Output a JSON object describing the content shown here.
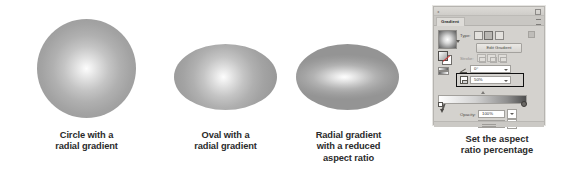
{
  "figures": [
    {
      "id": "circle-radial",
      "caption_lines": [
        "Circle with a",
        "radial gradient"
      ],
      "shape": "circle"
    },
    {
      "id": "oval-radial",
      "caption_lines": [
        "Oval with a",
        "radial gradient"
      ],
      "shape": "oval"
    },
    {
      "id": "oval-reduced-aspect",
      "caption_lines": [
        "Radial gradient",
        "with a reduced",
        "aspect ratio"
      ],
      "shape": "oval"
    },
    {
      "id": "gradient-panel",
      "caption_lines": [
        "Set the aspect",
        "ratio percentage"
      ],
      "shape": "panel"
    }
  ],
  "panel": {
    "tab_label": "Gradient",
    "type_label": "Type:",
    "type_options": [
      "linear",
      "radial",
      "freeform"
    ],
    "type_selected": "radial",
    "edit_gradient_label": "Edit Gradient",
    "stroke_label": "Stroke:",
    "angle_label": "Angle:",
    "angle_value": "0°",
    "aspect_ratio_label": "Aspect Ratio:",
    "aspect_ratio_value": "50%",
    "opacity_label": "Opacity:",
    "opacity_value": "100%",
    "location_label": "Location:",
    "location_value": "100%",
    "gradient_swatch_name": "radial-gradient-swatch",
    "ramp_start_color": "#ffffff",
    "ramp_end_color": "#4e4e4e"
  },
  "colors": {
    "panel_background": "#d4d2ce",
    "caption_text": "#2b2b2b",
    "highlight_border": "#111111",
    "shape_highlight": "#fdfdfd",
    "shape_shadow": "#949494"
  }
}
